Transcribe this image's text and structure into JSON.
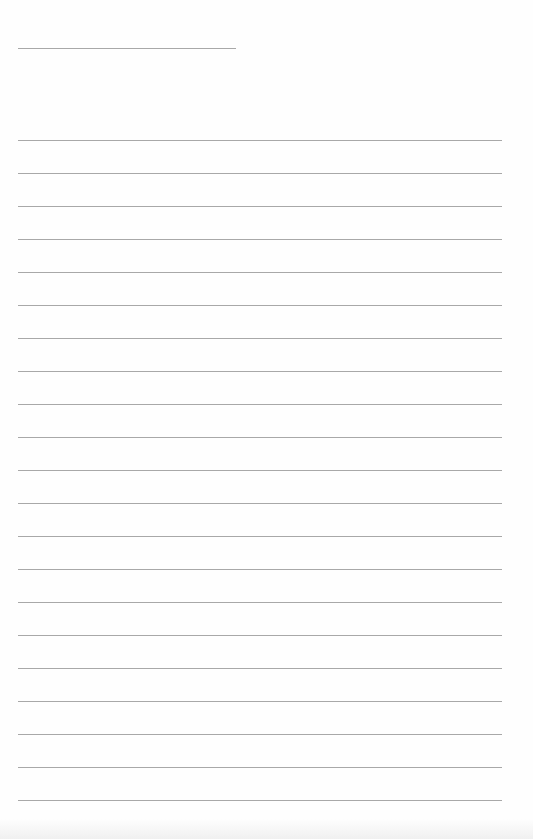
{
  "page": {
    "type": "lined-paper",
    "background_color": "#fefefe",
    "line_color": "#a8a8a8",
    "header_line": {
      "x": 18,
      "y": 48,
      "width": 218
    },
    "ruled_lines": {
      "x": 18,
      "width": 484,
      "start_y": 140,
      "spacing": 33,
      "count": 21
    },
    "text": []
  }
}
